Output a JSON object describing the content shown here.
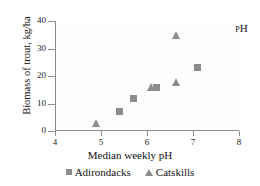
{
  "chart_data": {
    "type": "scatter",
    "title": "",
    "annotation": "pH",
    "xlabel": "Median weekly pH",
    "ylabel": "Biomass of trout, kg/ha",
    "xlim": [
      4,
      8
    ],
    "ylim": [
      0,
      40
    ],
    "xticks": [
      4,
      5,
      6,
      7,
      8
    ],
    "yticks": [
      0,
      10,
      20,
      30,
      40
    ],
    "xtick_labels": [
      "4",
      "5",
      "6",
      "7",
      "8"
    ],
    "ytick_labels": [
      "0",
      "10",
      "20",
      "30",
      "40"
    ],
    "grid": false,
    "legend_position": "bottom-center",
    "marker_color": "#8c8c8c",
    "axis_color": "#8a8a8a",
    "series": [
      {
        "name": "Adirondacks",
        "marker": "square",
        "points": [
          {
            "x": 5.4,
            "y": 7
          },
          {
            "x": 5.7,
            "y": 12
          },
          {
            "x": 6.2,
            "y": 16
          },
          {
            "x": 7.1,
            "y": 23
          }
        ]
      },
      {
        "name": "Catskills",
        "marker": "triangle",
        "points": [
          {
            "x": 4.9,
            "y": 3
          },
          {
            "x": 6.1,
            "y": 16
          },
          {
            "x": 6.65,
            "y": 18
          },
          {
            "x": 6.65,
            "y": 35
          }
        ]
      }
    ]
  },
  "legend": {
    "items": [
      {
        "label": "Adirondacks",
        "marker": "square"
      },
      {
        "label": "Catskills",
        "marker": "triangle"
      }
    ]
  }
}
